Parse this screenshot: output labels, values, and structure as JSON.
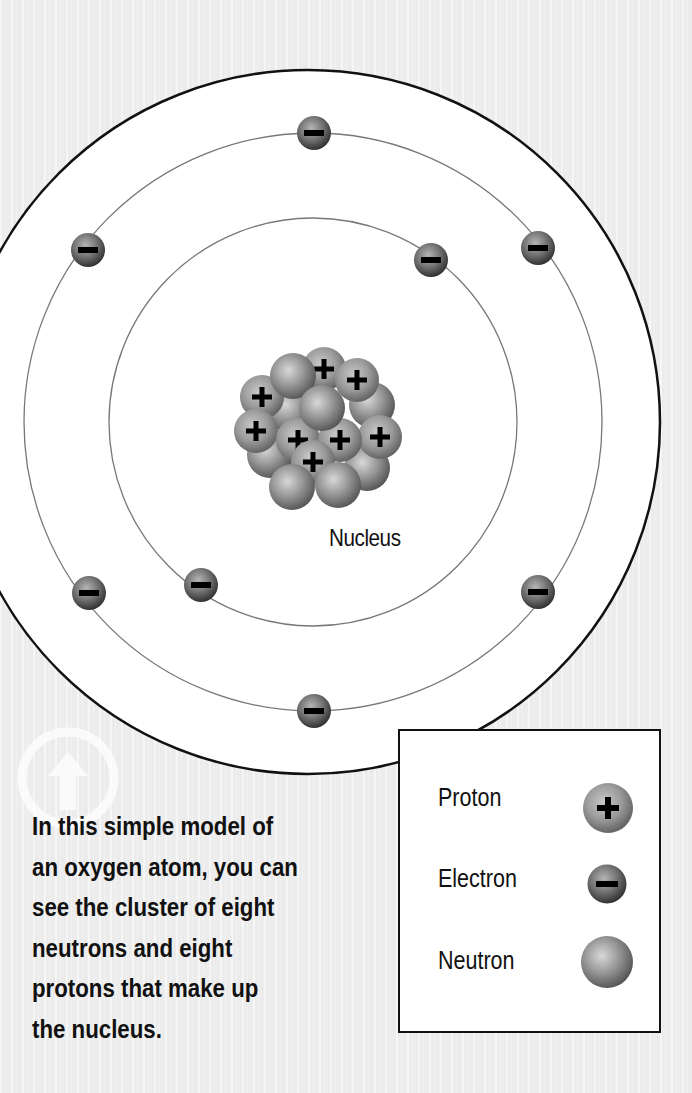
{
  "diagram": {
    "title": "Simple model of an oxygen atom",
    "nucleus_label": "Nucleus",
    "nucleus_composition": {
      "protons": 8,
      "neutrons": 8
    },
    "electrons": {
      "inner_shell": 2,
      "outer_shell": 6
    }
  },
  "legend": {
    "items": [
      {
        "label": "Proton",
        "symbol": "+",
        "icon": "proton-ball-icon"
      },
      {
        "label": "Electron",
        "symbol": "−",
        "icon": "electron-ball-icon"
      },
      {
        "label": "Neutron",
        "symbol": "",
        "icon": "neutron-ball-icon"
      }
    ]
  },
  "caption": {
    "lines": [
      "In this simple model of",
      "an oxygen atom, you can",
      "see the cluster of eight",
      "neutrons and eight",
      "protons that make up",
      "the nucleus."
    ]
  },
  "colors": {
    "background": "#ececec",
    "line": "#111111",
    "orbit": "#777777",
    "particle_light": "#c8c8c8",
    "particle_dark": "#5a5a5a"
  }
}
